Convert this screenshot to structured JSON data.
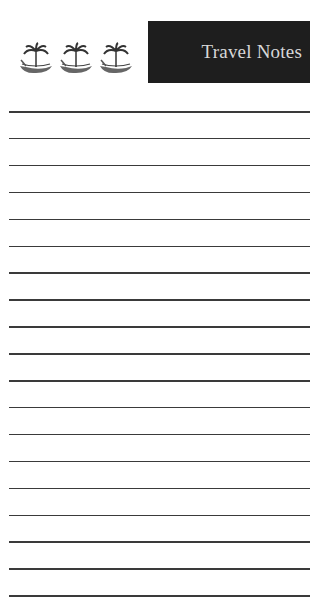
{
  "header": {
    "title": "Travel Notes",
    "icons": [
      "boat-palm-icon",
      "boat-palm-icon",
      "boat-palm-icon"
    ]
  },
  "colors": {
    "title_bg": "#1e1e1e",
    "title_text": "#d8d8d8",
    "rule": "#3a3a3a"
  },
  "ruled_lines": {
    "count": 19,
    "first_y": 111,
    "spacing": 26.9
  }
}
